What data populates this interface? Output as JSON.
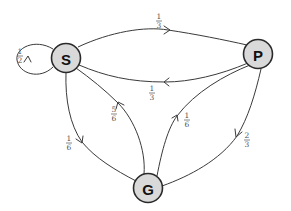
{
  "diagram": {
    "type": "state-transition-diagram",
    "nodes": [
      {
        "id": "S",
        "label": "S",
        "x": 66,
        "y": 58
      },
      {
        "id": "P",
        "label": "P",
        "x": 258,
        "y": 54
      },
      {
        "id": "G",
        "label": "G",
        "x": 148,
        "y": 188
      }
    ],
    "edges": [
      {
        "from": "S",
        "to": "S",
        "label": "1/2",
        "num": "1",
        "den": "2"
      },
      {
        "from": "S",
        "to": "P",
        "label": "1/3",
        "num": "1",
        "den": "3"
      },
      {
        "from": "P",
        "to": "S",
        "label": "1/3",
        "num": "1",
        "den": "3"
      },
      {
        "from": "S",
        "to": "G",
        "label": "1/6",
        "num": "1",
        "den": "6"
      },
      {
        "from": "G",
        "to": "S",
        "label": "5/6",
        "num": "5",
        "den": "6"
      },
      {
        "from": "G",
        "to": "P",
        "label": "1/6",
        "num": "1",
        "den": "6"
      },
      {
        "from": "P",
        "to": "G",
        "label": "2/3",
        "num": "2",
        "den": "3"
      }
    ],
    "colors": {
      "node_fill": "#d9d9d9",
      "node_stroke": "#2a2a2a",
      "edge": "#3a3a3a",
      "label": "#555555"
    }
  }
}
